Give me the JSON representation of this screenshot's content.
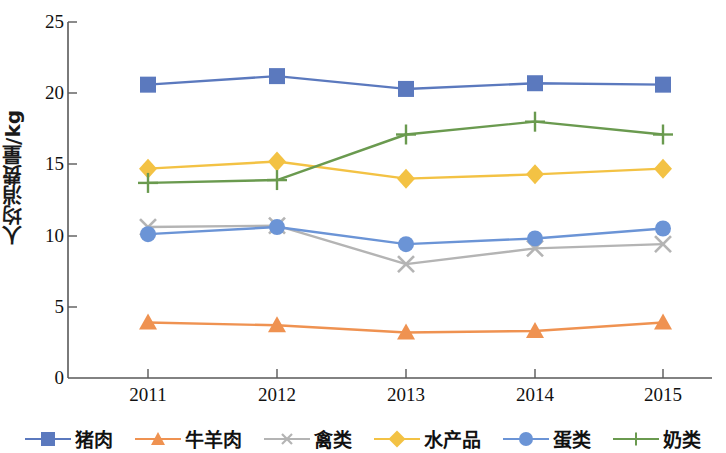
{
  "chart_data": {
    "type": "line",
    "title": "",
    "xlabel": "",
    "ylabel": "人均消费量/kg",
    "categories": [
      "2011",
      "2012",
      "2013",
      "2014",
      "2015"
    ],
    "ylim": [
      0,
      25
    ],
    "yticks": [
      0,
      5,
      10,
      15,
      20,
      25
    ],
    "grid": false,
    "legend_position": "bottom",
    "series": [
      {
        "name": "猪肉",
        "values": [
          20.6,
          21.2,
          20.3,
          20.7,
          20.6
        ],
        "color": "#5b79be",
        "marker": "square"
      },
      {
        "name": "牛羊肉",
        "values": [
          3.9,
          3.7,
          3.2,
          3.3,
          3.9
        ],
        "color": "#ef9251",
        "marker": "triangle"
      },
      {
        "name": "禽类",
        "values": [
          10.6,
          10.7,
          8.0,
          9.1,
          9.4
        ],
        "color": "#b4b4b4",
        "marker": "x"
      },
      {
        "name": "水产品",
        "values": [
          14.7,
          15.2,
          14.0,
          14.3,
          14.7
        ],
        "color": "#f3c244",
        "marker": "diamond"
      },
      {
        "name": "蛋类",
        "values": [
          10.1,
          10.6,
          9.4,
          9.8,
          10.5
        ],
        "color": "#6b94d6",
        "marker": "circle"
      },
      {
        "name": "奶类",
        "values": [
          13.7,
          13.9,
          17.1,
          18.0,
          17.1
        ],
        "color": "#6a9a4f",
        "marker": "plus"
      }
    ]
  },
  "axis": {
    "y_title": "人均消费量/kg",
    "y_tick_labels": [
      "25",
      "20",
      "15",
      "10",
      "5",
      "0"
    ],
    "x_tick_labels": [
      "2011",
      "2012",
      "2013",
      "2014",
      "2015"
    ]
  },
  "legend": {
    "items": [
      {
        "label": "猪肉"
      },
      {
        "label": "牛羊肉"
      },
      {
        "label": "禽类"
      },
      {
        "label": "水产品"
      },
      {
        "label": "蛋类"
      },
      {
        "label": "奶类"
      }
    ]
  },
  "colors": {
    "axis": "#595959",
    "text": "#111111",
    "background": "#ffffff"
  }
}
